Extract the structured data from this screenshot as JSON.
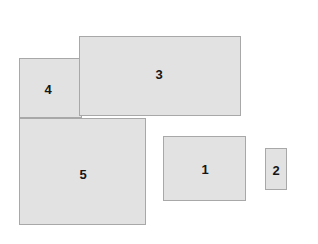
{
  "canvas": {
    "width": 318,
    "height": 244,
    "background_color": "#ffffff"
  },
  "style": {
    "fill_color": "#e2e2e2",
    "border_color": "#a8a8a8",
    "border_width": 1,
    "label_color": "#151515",
    "label_font_size": 13,
    "label_font_weight": "bold"
  },
  "shapes": [
    {
      "label": "4",
      "type": "rectangle",
      "x": 19,
      "y": 58,
      "width": 63,
      "height": 60,
      "z": 1,
      "label_x": 48,
      "label_y": 89
    },
    {
      "label": "3",
      "type": "rectangle",
      "x": 79,
      "y": 36,
      "width": 162,
      "height": 80,
      "z": 2,
      "label_x": 159,
      "label_y": 74
    },
    {
      "label": "5",
      "type": "rectangle",
      "x": 19,
      "y": 118,
      "width": 127,
      "height": 107,
      "z": 3,
      "label_x": 83,
      "label_y": 174
    },
    {
      "label": "1",
      "type": "rectangle",
      "x": 163,
      "y": 136,
      "width": 83,
      "height": 65,
      "z": 4,
      "label_x": 205,
      "label_y": 169
    },
    {
      "label": "2",
      "type": "rectangle",
      "x": 265,
      "y": 148,
      "width": 22,
      "height": 42,
      "z": 5,
      "label_x": 276,
      "label_y": 170
    }
  ]
}
